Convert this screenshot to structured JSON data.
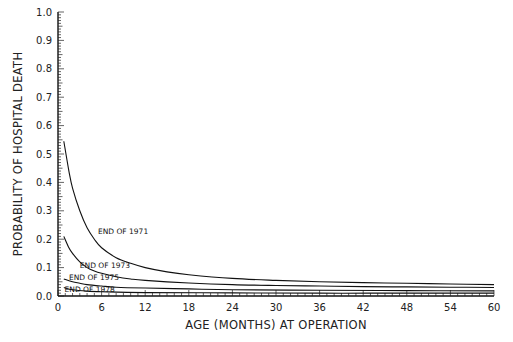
{
  "chart_data": {
    "type": "line",
    "title": "",
    "xlabel": "AGE (MONTHS) AT OPERATION",
    "ylabel": "PROBABILITY OF HOSPITAL DEATH",
    "xlim": [
      0,
      60
    ],
    "ylim": [
      0.0,
      1.0
    ],
    "xticks": [
      0,
      6,
      12,
      18,
      24,
      30,
      36,
      42,
      48,
      54,
      60
    ],
    "xtick_labels": [
      "0",
      "6",
      "12",
      "18",
      "24",
      "30",
      "36",
      "42",
      "48",
      "54",
      "60"
    ],
    "yticks": [
      0.0,
      0.1,
      0.2,
      0.3,
      0.4,
      0.5,
      0.6,
      0.7,
      0.8,
      0.9,
      1.0
    ],
    "ytick_labels": [
      "0.0",
      "0.1",
      "0.2",
      "0.3",
      "0.4",
      "0.5",
      "0.6",
      "0.7",
      "0.8",
      "0.9",
      "1.0"
    ],
    "grid": false,
    "legend": "inline curve labels",
    "series": [
      {
        "name": "END OF 1971",
        "x": [
          0.8,
          1.5,
          2,
          3,
          4,
          5,
          6,
          8,
          10,
          12,
          15,
          18,
          24,
          30,
          36,
          42,
          48,
          54,
          60
        ],
        "values": [
          0.545,
          0.44,
          0.38,
          0.3,
          0.24,
          0.2,
          0.17,
          0.135,
          0.115,
          0.1,
          0.085,
          0.075,
          0.062,
          0.055,
          0.05,
          0.047,
          0.045,
          0.042,
          0.04
        ]
      },
      {
        "name": "END OF 1973",
        "x": [
          0.8,
          1.5,
          2,
          3,
          4,
          5,
          6,
          8,
          10,
          12,
          18,
          24,
          30,
          36,
          42,
          48,
          54,
          60
        ],
        "values": [
          0.21,
          0.17,
          0.15,
          0.12,
          0.1,
          0.088,
          0.08,
          0.068,
          0.06,
          0.055,
          0.046,
          0.04,
          0.037,
          0.035,
          0.033,
          0.032,
          0.031,
          0.03
        ]
      },
      {
        "name": "END OF 1975",
        "x": [
          0.8,
          2,
          3,
          4,
          6,
          8,
          12,
          18,
          24,
          36,
          48,
          60
        ],
        "values": [
          0.06,
          0.05,
          0.045,
          0.04,
          0.035,
          0.031,
          0.028,
          0.025,
          0.022,
          0.02,
          0.019,
          0.018
        ]
      },
      {
        "name": "END OF 1978",
        "x": [
          0.8,
          2,
          4,
          6,
          12,
          24,
          36,
          48,
          60
        ],
        "values": [
          0.03,
          0.022,
          0.017,
          0.015,
          0.012,
          0.011,
          0.01,
          0.01,
          0.01
        ]
      }
    ],
    "annotations": [
      {
        "text": "END OF 1971",
        "x": 5.5,
        "y": 0.22
      },
      {
        "text": "END OF 1973",
        "x": 3.0,
        "y": 0.1
      },
      {
        "text": "END OF 1975",
        "x": 1.5,
        "y": 0.055
      },
      {
        "text": "END OF 1978",
        "x": 0.9,
        "y": 0.015
      }
    ]
  }
}
